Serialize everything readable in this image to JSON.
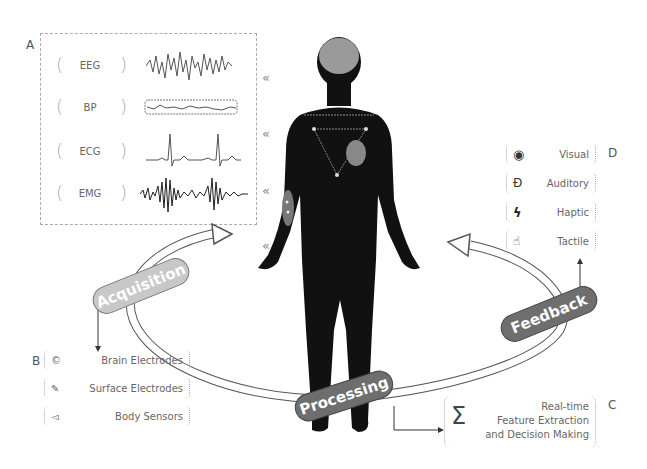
{
  "panels": {
    "A": {
      "letter": "A",
      "title": "Biosignals",
      "signals": [
        {
          "label": "EEG",
          "waveform": "eeg"
        },
        {
          "label": "BP",
          "waveform": "bp"
        },
        {
          "label": "ECG",
          "waveform": "ecg"
        },
        {
          "label": "EMG",
          "waveform": "emg"
        }
      ],
      "chevron": "«"
    },
    "B": {
      "letter": "B",
      "items": [
        {
          "icon": "brain-electrode-icon",
          "label": "Brain Electrodes"
        },
        {
          "icon": "surface-electrode-icon",
          "label": "Surface Electrodes"
        },
        {
          "icon": "body-sensor-icon",
          "label": "Body Sensors"
        }
      ]
    },
    "C": {
      "letter": "C",
      "symbol": "Σ",
      "lines": [
        "Real-time",
        "Feature Extraction",
        "and Decision Making"
      ]
    },
    "D": {
      "letter": "D",
      "items": [
        {
          "icon": "eye-icon",
          "glyph": "◉",
          "label": "Visual"
        },
        {
          "icon": "ear-icon",
          "glyph": "Ɖ",
          "label": "Auditory"
        },
        {
          "icon": "lightning-icon",
          "glyph": "ϟ",
          "label": "Haptic"
        },
        {
          "icon": "hand-icon",
          "glyph": "☝",
          "label": "Tactile"
        }
      ]
    }
  },
  "cycle": {
    "stages": [
      {
        "label": "Acquisition",
        "color": "#c8c8c8"
      },
      {
        "label": "Processing",
        "color": "#6e6e6e"
      },
      {
        "label": "Feedback",
        "color": "#6e6e6e"
      }
    ]
  },
  "colors": {
    "body": "#111111",
    "brain": "#9a9a9a",
    "heart": "#888888",
    "outline": "#444444"
  }
}
